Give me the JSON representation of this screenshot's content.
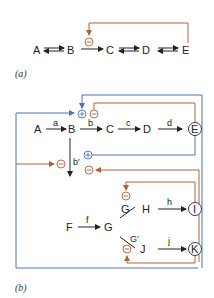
{
  "colors": {
    "inhibit": "#b0603a",
    "activate": "#4a74b4",
    "arrow": "#222222"
  },
  "panel_a": {
    "caption": "(a)",
    "nodes": [
      "A",
      "B",
      "C",
      "D",
      "E"
    ],
    "inhibitor_symbol": "⊖"
  },
  "panel_b": {
    "caption": "(b)",
    "main_path": {
      "nodes": [
        "A",
        "B",
        "C",
        "D",
        "E"
      ],
      "enzymes": [
        "a",
        "b",
        "c",
        "d"
      ]
    },
    "branch_enzyme": "b′",
    "second_path": {
      "F": "F",
      "f": "f",
      "G": "G",
      "G_upper": "G",
      "H": "H",
      "h": "h",
      "I": "I",
      "G_lower": "G′",
      "J": "J",
      "j": "j",
      "K": "K"
    },
    "plus": "+",
    "minus": "−"
  }
}
